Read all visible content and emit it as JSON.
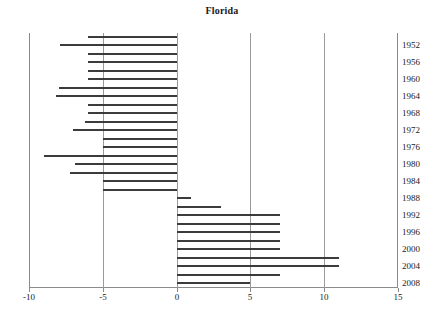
{
  "chart_data": {
    "type": "bar",
    "orientation": "horizontal",
    "title": "Florida",
    "xlabel": "",
    "ylabel": "",
    "xlim": [
      -10,
      15
    ],
    "ylim_categories_order": "top-to-bottom",
    "grid": true,
    "gridlines_x": [
      -10,
      -5,
      0,
      5,
      10,
      15
    ],
    "legend": "none",
    "xticks": [
      -10,
      -5,
      0,
      5,
      10,
      15
    ],
    "xtick_labels": [
      "-10",
      "-5",
      "0",
      "5",
      "10",
      "15"
    ],
    "ytick_labels": [
      "1952",
      "1956",
      "1960",
      "1964",
      "1968",
      "1972",
      "1976",
      "1980",
      "1984",
      "1988",
      "1992",
      "1996",
      "2000",
      "2004",
      "2008"
    ],
    "categories": [
      "1950",
      "1952",
      "1954",
      "1956",
      "1958",
      "1960",
      "1962",
      "1964",
      "1966",
      "1968",
      "1970",
      "1972",
      "1974",
      "1976",
      "1978",
      "1980",
      "1982",
      "1984",
      "1986",
      "1988",
      "1990",
      "1992",
      "1994",
      "1996",
      "1998",
      "2000",
      "2002",
      "2004",
      "2006",
      "2008"
    ],
    "values": [
      -6.0,
      -7.9,
      -6.0,
      -6.0,
      -6.0,
      -6.0,
      -8.0,
      -8.2,
      -6.0,
      -6.0,
      -6.2,
      -7.0,
      -5.0,
      -5.0,
      -9.0,
      -6.9,
      -7.2,
      -5.0,
      -5.0,
      1.0,
      3.0,
      7.0,
      7.0,
      7.0,
      7.0,
      7.0,
      11.0,
      11.0,
      7.0,
      5.0
    ],
    "bar_color": "#3b3b3b",
    "axis_color": "#8a8a8a"
  },
  "chart": {
    "title": "Florida",
    "x_axis": {
      "ticks": [
        {
          "value": -10,
          "label": "-10"
        },
        {
          "value": -5,
          "label": "-5"
        },
        {
          "value": 0,
          "label": "0"
        },
        {
          "value": 5,
          "label": "5"
        },
        {
          "value": 10,
          "label": "10"
        },
        {
          "value": 15,
          "label": "15"
        }
      ]
    },
    "y_axis": {
      "labels": [
        "1952",
        "1956",
        "1960",
        "1964",
        "1968",
        "1972",
        "1976",
        "1980",
        "1984",
        "1988",
        "1992",
        "1996",
        "2000",
        "2004",
        "2008"
      ]
    }
  }
}
